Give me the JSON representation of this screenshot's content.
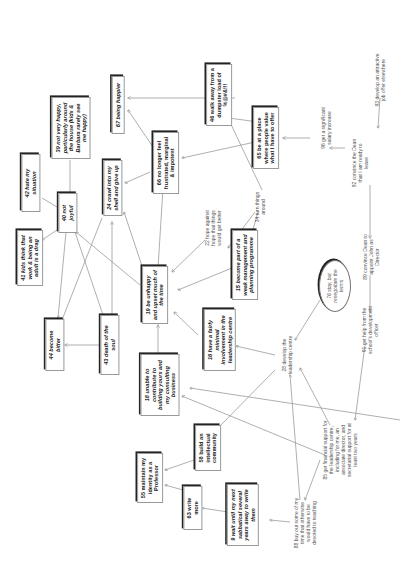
{
  "diagram": {
    "nodes": [
      {
        "id": "n67",
        "label": "67 being happier",
        "style": "box",
        "x": 118,
        "y": 105,
        "w": 58
      },
      {
        "id": "n46",
        "label": "46 walk away from a dumpster load of %@#&!!!",
        "style": "box upright",
        "x": 219,
        "y": 95,
        "w": 62
      },
      {
        "id": "n39",
        "label": "39 not very happy, particularly around the house (kids & Barbara rarely see me happy)",
        "style": "box",
        "x": 71,
        "y": 128,
        "w": 62
      },
      {
        "id": "n66",
        "label": "66 no longer feel frustrated, marginal & impotent",
        "style": "box upright",
        "x": 166,
        "y": 163,
        "w": 62
      },
      {
        "id": "n65",
        "label": "65 be at a place where people value what I have to offer",
        "style": "box upright",
        "x": 266,
        "y": 138,
        "w": 62
      },
      {
        "id": "n93",
        "label": "93 develop an attractive job offer elsewhere",
        "style": "plain",
        "x": 380,
        "y": 80,
        "w": 54
      },
      {
        "id": "n96",
        "label": "96 get a significant salary increase",
        "style": "plain",
        "x": 326,
        "y": 128,
        "w": 48
      },
      {
        "id": "n92",
        "label": "92 convince the Dean that I am ready to leave",
        "style": "plain",
        "x": 360,
        "y": 163,
        "w": 52
      },
      {
        "id": "n42",
        "label": "42 hate my situation",
        "style": "box",
        "x": 31,
        "y": 183,
        "w": 58
      },
      {
        "id": "n24",
        "label": "24 crawl into my shell and give up",
        "style": "box",
        "x": 113,
        "y": 188,
        "w": 56
      },
      {
        "id": "n34",
        "label": "34 turn things around",
        "style": "plain",
        "x": 260,
        "y": 207,
        "w": 36
      },
      {
        "id": "n40",
        "label": "40 not joyful",
        "style": "box",
        "x": 68,
        "y": 213,
        "w": 40
      },
      {
        "id": "n22",
        "label": "22 hope against hope that things would get better",
        "style": "plain",
        "x": 213,
        "y": 228,
        "w": 48
      },
      {
        "id": "n41",
        "label": "41 kids think that work & being an adult is a drag",
        "style": "box",
        "x": 30,
        "y": 258,
        "w": 56
      },
      {
        "id": "n19",
        "label": "19 be unhappy and upset much of the time",
        "style": "box",
        "x": 155,
        "y": 295,
        "w": 58
      },
      {
        "id": "n15",
        "label": "15 become part of a weak management and planning programme",
        "style": "box",
        "x": 245,
        "y": 265,
        "w": 70
      },
      {
        "id": "n76",
        "label": "76 stay, but renegotiate the terms",
        "style": "oval",
        "x": 335,
        "y": 286,
        "w": 52
      },
      {
        "id": "n89",
        "label": "89 convince Dean to appoint John as Director",
        "style": "plain",
        "x": 371,
        "y": 257,
        "w": 52
      },
      {
        "id": "n44",
        "label": "44 become bitter",
        "style": "box",
        "x": 55,
        "y": 345,
        "w": 52
      },
      {
        "id": "n43",
        "label": "43 death of the soul",
        "style": "box",
        "x": 110,
        "y": 345,
        "w": 60
      },
      {
        "id": "n16",
        "label": "16 have a fairly minimal involvement in the leadership centre",
        "style": "box",
        "x": 220,
        "y": 340,
        "w": 62
      },
      {
        "id": "n28",
        "label": "28 develop the leadership centre",
        "style": "plain",
        "x": 287,
        "y": 355,
        "w": 44
      },
      {
        "id": "n91",
        "label": "91 get help from the school's development officer",
        "style": "plain",
        "x": 370,
        "y": 330,
        "w": 52
      },
      {
        "id": "n18",
        "label": "18 unable to contribute to building yours and my consulting business",
        "style": "box",
        "x": 160,
        "y": 385,
        "w": 62
      },
      {
        "id": "n58",
        "label": "58 build an intellectual community",
        "style": "box upright",
        "x": 208,
        "y": 448,
        "w": 46
      },
      {
        "id": "n85",
        "label": "85 get financial support for the leadership centre, including for me, an associate director, and secretarial support for at least two years",
        "style": "plain",
        "x": 340,
        "y": 450,
        "w": 64
      },
      {
        "id": "n55",
        "label": "55 maintain my identity as a Professor",
        "style": "box upright",
        "x": 150,
        "y": 478,
        "w": 50
      },
      {
        "id": "n63",
        "label": "63 write more",
        "style": "box upright",
        "x": 193,
        "y": 508,
        "w": 44
      },
      {
        "id": "n9",
        "label": "9 wait until my next sabbatical several years away to write them",
        "style": "box",
        "x": 243,
        "y": 515,
        "w": 62
      },
      {
        "id": "n88",
        "label": "88 buy out some of my time that otherwise would have to be devoted to teaching",
        "style": "plain",
        "x": 305,
        "y": 523,
        "w": 54
      }
    ],
    "edges": [
      {
        "from": [
          235,
          98
        ],
        "to": [
          128,
          98
        ],
        "comment": "46 -> 67"
      },
      {
        "from": [
          155,
          150
        ],
        "to": [
          128,
          110
        ],
        "comment": "66 -> 67"
      },
      {
        "from": [
          258,
          122
        ],
        "to": [
          229,
          118
        ],
        "comment": "65 -> 46 area"
      },
      {
        "from": [
          255,
          142
        ],
        "to": [
          182,
          158
        ],
        "comment": "65 -> 66"
      },
      {
        "from": [
          380,
          98
        ],
        "to": [
          378,
          128
        ],
        "comment": "93 -> 92"
      },
      {
        "from": [
          345,
          148
        ],
        "to": [
          330,
          148
        ],
        "comment": "92 -> 96 approx"
      },
      {
        "from": [
          310,
          138
        ],
        "to": [
          283,
          138
        ],
        "comment": "96 -> 65"
      },
      {
        "from": [
          262,
          190
        ],
        "to": [
          228,
          118
        ],
        "comment": "34 -> 46"
      },
      {
        "from": [
          255,
          212
        ],
        "to": [
          228,
          248
        ],
        "comment": "34 -> 22"
      },
      {
        "from": [
          258,
          212
        ],
        "to": [
          250,
          240
        ],
        "comment": "34 -> 15"
      },
      {
        "from": [
          370,
          185
        ],
        "to": [
          370,
          238
        ],
        "comment": "92 -> 89"
      },
      {
        "from": [
          370,
          275
        ],
        "to": [
          370,
          312
        ],
        "comment": "89 -> 91"
      },
      {
        "from": [
          320,
          300
        ],
        "to": [
          295,
          340
        ],
        "comment": "76 -> 28"
      },
      {
        "from": [
          150,
          172
        ],
        "to": [
          125,
          183
        ],
        "comment": "66 -> 24"
      },
      {
        "from": [
          163,
          188
        ],
        "to": [
          158,
          268
        ],
        "comment": "66 -> 19"
      },
      {
        "from": [
          70,
          160
        ],
        "to": [
          70,
          195
        ],
        "comment": "39 -> 40"
      },
      {
        "from": [
          42,
          198
        ],
        "to": [
          62,
          210
        ],
        "comment": "42 -> 40"
      },
      {
        "from": [
          60,
          228
        ],
        "to": [
          42,
          240
        ],
        "comment": "40 -> 41"
      },
      {
        "from": [
          66,
          232
        ],
        "to": [
          58,
          318
        ],
        "comment": "40 -> 44"
      },
      {
        "from": [
          75,
          232
        ],
        "to": [
          104,
          318
        ],
        "comment": "40 -> 43"
      },
      {
        "from": [
          140,
          285
        ],
        "to": [
          76,
          232
        ],
        "comment": "19 -> 40"
      },
      {
        "from": [
          145,
          275
        ],
        "to": [
          124,
          212
        ],
        "comment": "19 -> 24"
      },
      {
        "from": [
          102,
          218
        ],
        "to": [
          62,
          320
        ],
        "comment": "24 -> 44"
      },
      {
        "from": [
          112,
          318
        ],
        "to": [
          112,
          222
        ],
        "comment": "43 -> 24"
      },
      {
        "from": [
          103,
          345
        ],
        "to": [
          65,
          345
        ],
        "comment": "43 -> 44"
      },
      {
        "from": [
          205,
          240
        ],
        "to": [
          172,
          272
        ],
        "comment": "22 -> 19"
      },
      {
        "from": [
          232,
          268
        ],
        "to": [
          178,
          290
        ],
        "comment": "15 -> 19"
      },
      {
        "from": [
          198,
          335
        ],
        "to": [
          174,
          312
        ],
        "comment": "16 -> 19"
      },
      {
        "from": [
          158,
          360
        ],
        "to": [
          158,
          325
        ],
        "comment": "18 -> 19"
      },
      {
        "from": [
          275,
          355
        ],
        "to": [
          236,
          346
        ],
        "comment": "28 -> 16"
      },
      {
        "from": [
          275,
          370
        ],
        "to": [
          218,
          428
        ],
        "comment": "28 -> 58"
      },
      {
        "from": [
          330,
          425
        ],
        "to": [
          300,
          368
        ],
        "comment": "85 -> 28"
      },
      {
        "from": [
          325,
          455
        ],
        "to": [
          182,
          396
        ],
        "comment": "85 -> 18 (long)"
      },
      {
        "from": [
          320,
          460
        ],
        "to": [
          305,
          500
        ],
        "comment": "85 -> 88"
      },
      {
        "from": [
          365,
          345
        ],
        "to": [
          355,
          420
        ],
        "comment": "91 -> 85"
      },
      {
        "from": [
          300,
          500
        ],
        "to": [
          290,
          375
        ],
        "comment": "88 -> 28"
      },
      {
        "from": [
          290,
          522
        ],
        "to": [
          270,
          520
        ],
        "comment": "88 -> 9"
      },
      {
        "from": [
          228,
          512
        ],
        "to": [
          202,
          508
        ],
        "comment": "9 -> 63"
      },
      {
        "from": [
          190,
          492
        ],
        "to": [
          165,
          485
        ],
        "comment": "63 -> 55"
      },
      {
        "from": [
          200,
          458
        ],
        "to": [
          165,
          470
        ],
        "comment": "58 -> 55"
      },
      {
        "from": [
          400,
          420
        ],
        "to": [
          190,
          388
        ],
        "comment": "long line into 18"
      }
    ]
  }
}
